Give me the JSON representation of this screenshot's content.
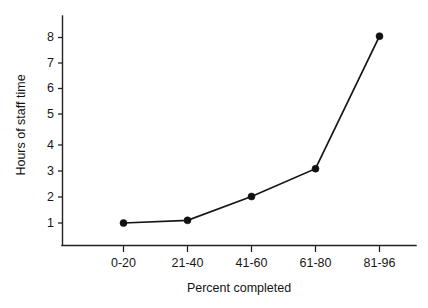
{
  "chart_data": {
    "type": "line",
    "title": "",
    "subtitle": "",
    "xlabel": "Percent completed",
    "ylabel": "Hours of staff time",
    "categories": [
      "0-20",
      "21-40",
      "41-60",
      "61-80",
      "81-96"
    ],
    "values": [
      1.0,
      1.1,
      2.0,
      3.05,
      8.05
    ],
    "series": [
      {
        "name": "Hours of staff time",
        "values": [
          1.0,
          1.1,
          2.0,
          3.05,
          8.05
        ]
      }
    ],
    "ytick_labels": [
      "1",
      "2",
      "3",
      "4",
      "5",
      "6",
      "7",
      "8"
    ],
    "ytick_values": [
      1,
      2,
      3,
      4,
      5,
      6,
      7,
      8
    ],
    "xtick_labels": [
      "0-20",
      "21-40",
      "41-60",
      "61-80",
      "81-96"
    ],
    "ylim": [
      0.3,
      8.6
    ],
    "xlim": [
      0,
      6
    ],
    "grid": false,
    "legend": false,
    "legend_position": "none",
    "marker": "filled-circle",
    "line_color": "#151515",
    "marker_color": "#111111",
    "axis_color": "#222222",
    "background_color": "#ffffff",
    "annotations": []
  },
  "figure": {
    "x_axis_label": "Percent completed",
    "y_axis_label": "Hours of staff time"
  }
}
